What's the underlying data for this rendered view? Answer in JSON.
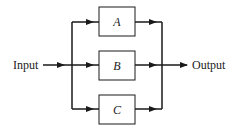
{
  "diagram": {
    "type": "parallel block diagram",
    "input_label": "Input",
    "output_label": "Output",
    "blocks": [
      {
        "label": "A"
      },
      {
        "label": "B"
      },
      {
        "label": "C"
      }
    ],
    "colors": {
      "stroke": "#1a1a1a",
      "background": "#ffffff"
    }
  }
}
